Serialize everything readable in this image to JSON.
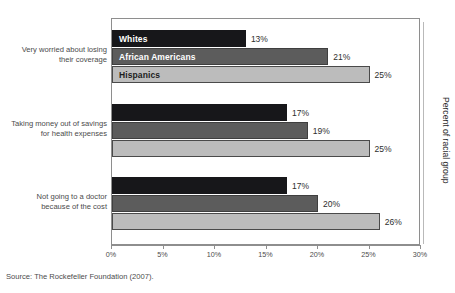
{
  "figure": {
    "title": "",
    "source_note": "Source: The Rockefeller Foundation (2007).",
    "y_axis_title": "Percent of racial group"
  },
  "chart_data": {
    "type": "bar",
    "orientation": "horizontal",
    "title": "",
    "xlabel": "",
    "ylabel": "Percent of racial group",
    "xlim": [
      0,
      30
    ],
    "x_tick_labels": [
      "0%",
      "5%",
      "10%",
      "15%",
      "20%",
      "25%",
      "30%"
    ],
    "x_ticks": [
      0,
      5,
      10,
      15,
      20,
      25,
      30
    ],
    "grid": false,
    "legend_position": "inside-bars-first-group",
    "categories": [
      "Very worried about losing their coverage",
      "Taking money out of savings for health expenses",
      "Not going to a doctor because of the cost"
    ],
    "category_lines": [
      [
        "Very worried about losing",
        "their coverage"
      ],
      [
        "Taking money out of savings",
        "for health expenses"
      ],
      [
        "Not going to a doctor",
        "because of the cost"
      ]
    ],
    "series": [
      {
        "name": "Whites",
        "color": "#17171a",
        "values": [
          13,
          17,
          17
        ],
        "labels": [
          "13%",
          "17%",
          "17%"
        ]
      },
      {
        "name": "African Americans",
        "color": "#5c5c5c",
        "values": [
          21,
          19,
          20
        ],
        "labels": [
          "21%",
          "19%",
          "20%"
        ]
      },
      {
        "name": "Hispanics",
        "color": "#bcbcbc",
        "values": [
          25,
          25,
          26
        ],
        "labels": [
          "25%",
          "25%",
          "26%"
        ]
      }
    ]
  }
}
